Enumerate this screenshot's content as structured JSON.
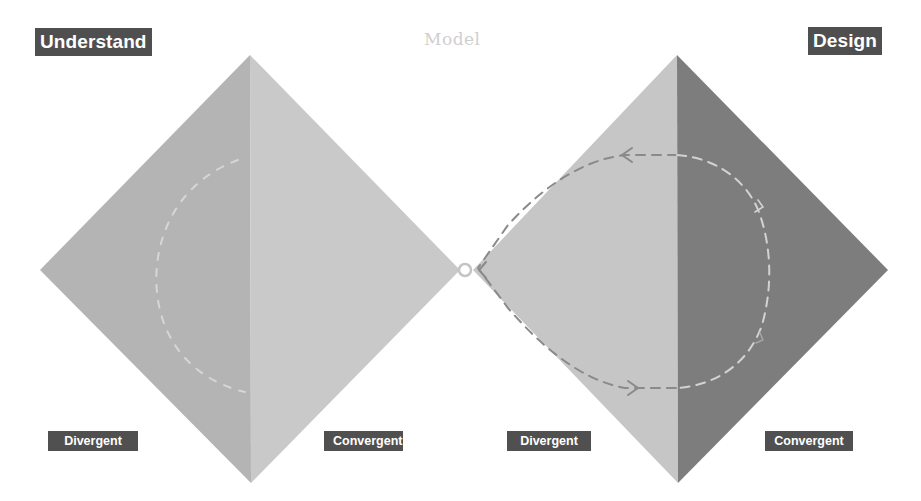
{
  "diagram": {
    "stages": [
      {
        "label": "Understand",
        "style": "dark-box"
      },
      {
        "label": "Model",
        "style": "faded-text"
      },
      {
        "label": "Design",
        "style": "dark-box"
      }
    ],
    "phases": [
      {
        "label": "Divergent",
        "diamond": "left",
        "half": "left"
      },
      {
        "label": "Convergent",
        "diamond": "left",
        "half": "right"
      },
      {
        "label": "Divergent",
        "diamond": "right",
        "half": "left"
      },
      {
        "label": "Convergent",
        "diamond": "right",
        "half": "right"
      }
    ],
    "diamonds": [
      {
        "name": "understand-diamond",
        "left_half_color": "#b4b4b4",
        "right_half_color": "#c9c9c9",
        "loop_arrow": "faint-dashed-loop"
      },
      {
        "name": "design-diamond",
        "left_half_color": "#c6c6c6",
        "right_half_color": "#7d7d7d",
        "loop_arrow": "dashed-loop-clockwise"
      }
    ],
    "connector": {
      "shape": "circle",
      "position": "junction-between-diamonds"
    },
    "colors": {
      "label_bg": "#4f4f4f",
      "label_text": "#ffffff",
      "model_text": "#cfcfcf",
      "arrow_dark": "#8a8a8a",
      "arrow_light": "#d2d2d2"
    }
  }
}
